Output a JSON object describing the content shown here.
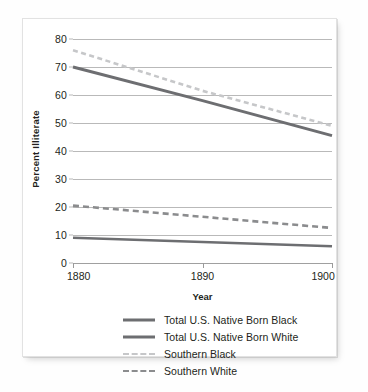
{
  "chart_data": {
    "type": "line",
    "title": "",
    "xlabel": "Year",
    "ylabel": "Percent Illiterate",
    "x": [
      1880,
      1890,
      1900
    ],
    "xlim": [
      1880,
      1900
    ],
    "ylim": [
      0,
      80
    ],
    "yticks": [
      0,
      10,
      20,
      30,
      40,
      50,
      60,
      70,
      80
    ],
    "xticks": [
      1880,
      1890,
      1900
    ],
    "xtick_labels": [
      "1880",
      "1890",
      "1900"
    ],
    "ytick_labels": [
      "0",
      "10",
      "20",
      "30",
      "40",
      "50",
      "60",
      "70",
      "80"
    ],
    "grid": true,
    "legend_position": "below",
    "series": [
      {
        "name": "Total U.S. Native Born Black",
        "values": [
          70,
          58,
          45.5
        ],
        "style": "solid",
        "color": "#6d6e71",
        "width": 3
      },
      {
        "name": "Total U.S. Native Born White",
        "values": [
          9,
          7.5,
          6
        ],
        "style": "solid",
        "color": "#6d6e71",
        "width": 2.6
      },
      {
        "name": "Southern Black",
        "values": [
          76,
          61.5,
          49
        ],
        "style": "dashed",
        "color": "#c6c7c9",
        "width": 2.6
      },
      {
        "name": "Southern White",
        "values": [
          20.5,
          16.5,
          12.5
        ],
        "style": "dashed",
        "color": "#8b8c8e",
        "width": 2.6
      }
    ]
  },
  "legend": {
    "items": [
      {
        "label": "Total U.S. Native Born Black",
        "swatch": "sw-solid-black"
      },
      {
        "label": "Total U.S. Native Born White",
        "swatch": "sw-solid-white"
      },
      {
        "label": "Southern Black",
        "swatch": "sw-dash-black"
      },
      {
        "label": "Southern White",
        "swatch": "sw-dash-white"
      }
    ]
  }
}
